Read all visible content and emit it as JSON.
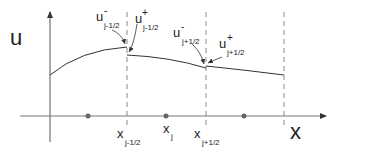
{
  "figure": {
    "y_axis_label": "u",
    "x_axis_label": "x",
    "interface_left": {
      "u_minus": {
        "base": "u",
        "sup": "-",
        "sub": "j-1/2"
      },
      "u_plus": {
        "base": "u",
        "sup": "+",
        "sub": "j-1/2"
      },
      "x_label": {
        "base": "x",
        "sub": "j-1/2"
      }
    },
    "interface_right": {
      "u_minus": {
        "base": "u",
        "sup": "-",
        "sub": "j+1/2"
      },
      "u_plus": {
        "base": "u",
        "sup": "+",
        "sub": "j+1/2"
      },
      "x_label": {
        "base": "x",
        "sub": "j+1/2"
      }
    },
    "cell_center": {
      "base": "x",
      "sub": "j"
    },
    "colors": {
      "axis": "#555555",
      "curve": "#333333",
      "dashed": "#888888",
      "dot": "#666666",
      "text": "#222222"
    }
  }
}
